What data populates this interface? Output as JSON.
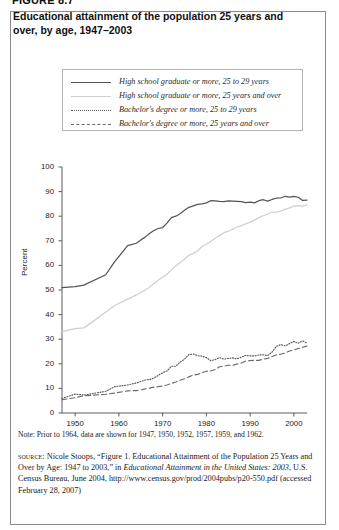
{
  "figure": {
    "label": "FIGURE 8.7",
    "title": "Educational attainment of the population 25 years and over, by age, 1947–2003"
  },
  "legend": {
    "items": [
      {
        "label": "High school graduate or more, 25 to 29 years",
        "style": "solid-dark",
        "color": "#545454"
      },
      {
        "label": "High school graduate or more, 25 years and over",
        "style": "solid-light",
        "color": "#cfcfcf"
      },
      {
        "label": "Bachelor's degree or more, 25 to 29 years",
        "style": "dotted",
        "color": "#5a5a5a"
      },
      {
        "label": "Bachelor's degree or more, 25 years and over",
        "style": "dashed",
        "color": "#6a6a6a"
      }
    ]
  },
  "note": {
    "text": "Note: Prior to 1964, data are shown for 1947, 1950, 1952, 1957, 1959, and 1962."
  },
  "source": {
    "kicker": "source:",
    "line1": " Nicole Stoops, “Figure 1. Educational Attainment of the Population 25 Years and Over by Age: 1947 to 2003,” in ",
    "italic1": "Educational Attainment in the United States: 2003",
    "line2": ", U.S. Census Bureau, June 2004, http://www.census.gov/prod/2004pubs/p20-550.pdf (accessed February 28, 2007)"
  },
  "chart_data": {
    "type": "line",
    "title": "Educational attainment of the population 25 years and over, by age, 1947–2003",
    "xlabel": "",
    "ylabel": "Percent",
    "xlim": [
      1947,
      2003
    ],
    "ylim": [
      0,
      100
    ],
    "xticks": [
      1950,
      1960,
      1970,
      1980,
      1990,
      2000
    ],
    "yticks": [
      0,
      10,
      20,
      30,
      40,
      50,
      60,
      70,
      80,
      90,
      100
    ],
    "grid": false,
    "legend_position": "upper-left-inset",
    "x": [
      1947,
      1950,
      1952,
      1957,
      1959,
      1962,
      1964,
      1965,
      1966,
      1967,
      1968,
      1969,
      1970,
      1971,
      1972,
      1973,
      1974,
      1975,
      1976,
      1977,
      1978,
      1979,
      1980,
      1981,
      1982,
      1983,
      1984,
      1985,
      1986,
      1987,
      1988,
      1989,
      1990,
      1991,
      1992,
      1993,
      1994,
      1995,
      1996,
      1997,
      1998,
      1999,
      2000,
      2001,
      2002,
      2003
    ],
    "series": [
      {
        "name": "High school graduate or more, 25 to 29 years",
        "style": "solid",
        "color": "#545454",
        "values": [
          51.0,
          51.4,
          52.0,
          56.2,
          61.4,
          68.0,
          69.0,
          70.3,
          71.5,
          73.0,
          74.2,
          75.0,
          75.4,
          77.2,
          79.4,
          80.0,
          81.0,
          82.4,
          83.6,
          84.2,
          84.8,
          85.0,
          85.4,
          86.3,
          86.2,
          86.0,
          85.9,
          86.2,
          86.1,
          86.0,
          85.9,
          85.5,
          85.7,
          85.4,
          86.3,
          86.7,
          86.1,
          86.8,
          87.3,
          87.4,
          88.1,
          87.8,
          88.1,
          87.7,
          86.4,
          86.5
        ]
      },
      {
        "name": "High school graduate or more, 25 years and over",
        "style": "solid",
        "color": "#cfcfcf",
        "values": [
          33.1,
          34.3,
          34.6,
          41.0,
          43.7,
          46.3,
          48.0,
          49.0,
          49.9,
          51.1,
          52.6,
          54.0,
          55.2,
          56.4,
          58.2,
          59.8,
          61.2,
          62.5,
          64.1,
          64.9,
          65.9,
          67.7,
          68.6,
          69.7,
          71.0,
          72.1,
          73.3,
          73.9,
          74.7,
          75.6,
          76.2,
          76.9,
          77.6,
          78.4,
          79.4,
          80.2,
          80.9,
          81.7,
          81.7,
          82.1,
          82.8,
          83.4,
          84.1,
          84.3,
          84.1,
          84.6
        ]
      },
      {
        "name": "Bachelor's degree or more, 25 to 29 years",
        "style": "dotted",
        "color": "#5a5a5a",
        "values": [
          5.9,
          7.7,
          7.3,
          8.8,
          10.7,
          11.4,
          12.2,
          12.8,
          13.4,
          13.6,
          14.2,
          15.3,
          16.4,
          17.1,
          19.0,
          19.0,
          20.7,
          21.9,
          23.7,
          24.0,
          23.3,
          23.1,
          22.5,
          21.3,
          21.7,
          22.5,
          21.9,
          22.2,
          22.4,
          22.0,
          22.7,
          23.4,
          23.2,
          23.2,
          23.6,
          23.7,
          23.3,
          24.7,
          27.1,
          27.8,
          27.3,
          28.2,
          29.1,
          28.4,
          29.3,
          28.4
        ]
      },
      {
        "name": "Bachelor's degree or more, 25 years and over",
        "style": "dashed",
        "color": "#6a6a6a",
        "values": [
          5.4,
          6.2,
          7.0,
          7.6,
          8.1,
          9.0,
          9.1,
          9.4,
          9.8,
          10.1,
          10.5,
          10.7,
          11.0,
          11.4,
          12.0,
          12.6,
          13.3,
          13.9,
          14.7,
          15.4,
          15.7,
          16.4,
          17.0,
          17.1,
          17.7,
          18.8,
          19.1,
          19.4,
          19.4,
          19.9,
          20.3,
          21.1,
          21.3,
          21.4,
          21.4,
          21.9,
          22.2,
          23.0,
          23.6,
          23.9,
          24.4,
          25.2,
          25.6,
          26.2,
          26.7,
          27.2
        ]
      }
    ]
  }
}
